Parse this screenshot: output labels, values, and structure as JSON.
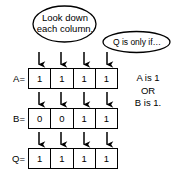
{
  "diagram": {
    "callouts": [
      {
        "id": "look-down-each-column",
        "line1": "Look down",
        "line2": "each column."
      },
      {
        "id": "q-is-only-if",
        "line1": "Q is only if…"
      }
    ],
    "rows": [
      {
        "label": "A=",
        "values": [
          "1",
          "1",
          "1",
          "1"
        ]
      },
      {
        "label": "B=",
        "values": [
          "0",
          "0",
          "1",
          "1"
        ]
      },
      {
        "label": "Q=",
        "values": [
          "1",
          "1",
          "1",
          "1"
        ]
      }
    ],
    "side_note": {
      "line1": "A is 1",
      "line2": "OR",
      "line3": "B is 1."
    },
    "colors": {
      "stroke": "#000000",
      "background": "#ffffff",
      "text": "#000000"
    },
    "arrow_icon_name": "down-arrow-icon",
    "columns": 4
  }
}
